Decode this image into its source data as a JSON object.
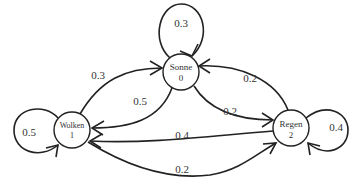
{
  "diagram": {
    "type": "markov-chain",
    "states": [
      {
        "id": "0",
        "name": "Sonne",
        "index": "0"
      },
      {
        "id": "1",
        "name": "Wolken",
        "index": "1"
      },
      {
        "id": "2",
        "name": "Regen",
        "index": "2"
      }
    ],
    "transitions": {
      "sonne_sonne": "0.3",
      "wolken_wolken": "0.5",
      "regen_regen": "0.4",
      "wolken_sonne": "0.3",
      "sonne_wolken": "0.5",
      "sonne_regen": "0.2",
      "regen_sonne": "0.2",
      "regen_wolken": "0.4",
      "wolken_regen": "0.2"
    }
  }
}
